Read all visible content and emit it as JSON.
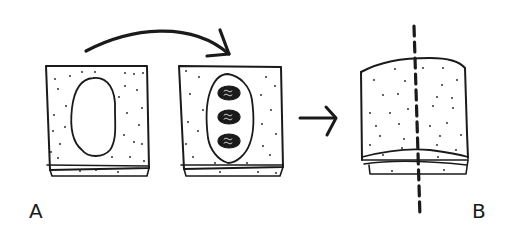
{
  "figure": {
    "labels": {
      "a": "A",
      "b": "B"
    },
    "panels": [
      {
        "id": "block-empty-cavity",
        "description": "dotted block with empty oval cavity"
      },
      {
        "id": "block-filled-cavity",
        "description": "dotted block with cavity containing three hatched dark ovals"
      },
      {
        "id": "block-sectioned",
        "description": "dotted block with layered base and vertical dashed cut line"
      }
    ],
    "arrows": [
      {
        "id": "curved-arrow",
        "from": "block-empty-cavity",
        "to": "block-filled-cavity"
      },
      {
        "id": "straight-arrow",
        "from": "block-filled-cavity",
        "to": "block-sectioned"
      }
    ],
    "colors": {
      "ink": "#1a1a1a",
      "background": "#ffffff"
    }
  }
}
